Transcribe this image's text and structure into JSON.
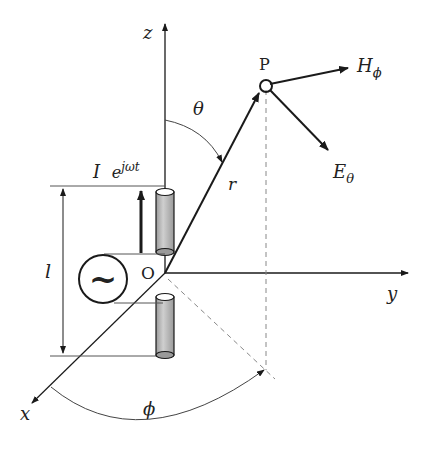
{
  "figure": {
    "type": "hertzian-dipole-radiation-geometry",
    "axes": {
      "x_label": "x",
      "y_label": "y",
      "z_label": "z"
    },
    "origin_label": "O",
    "point_label": "P",
    "radius_label": "r",
    "theta_label": "θ",
    "phi_label": "ϕ",
    "length_label": "l",
    "current_label_base": "I",
    "current_label_exp": "e",
    "current_label_sup": "jωt",
    "field_h": {
      "base": "H",
      "sub": "ϕ"
    },
    "field_e": {
      "base": "E",
      "sub": "θ"
    },
    "source_symbol": "~",
    "colors": {
      "line": "#1a1a1a",
      "thin_line": "#555555",
      "dashed": "#888888",
      "cylinder_fill": "#bdbdbd"
    }
  }
}
